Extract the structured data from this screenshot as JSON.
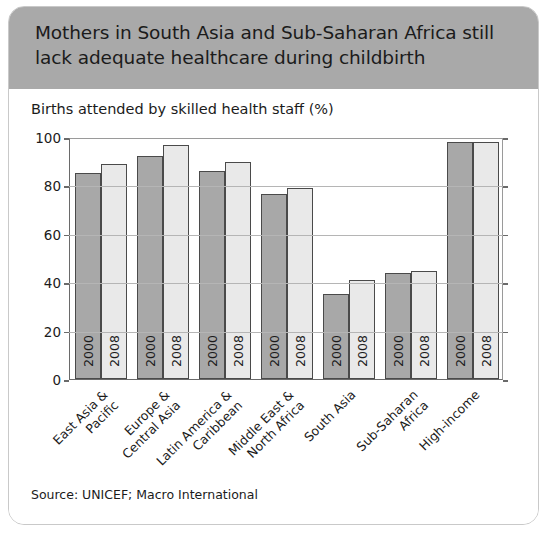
{
  "card": {
    "header_title": "Mothers in South Asia and Sub-Saharan Africa still\nlack adequate healthcare during childbirth",
    "subtitle": "Births attended by skilled health staff (%)",
    "source": "Source: UNICEF; Macro International"
  },
  "colors": {
    "header_band": "#a9a9a9",
    "bar_2000": "#a8a8a8",
    "bar_2008": "#e9e9e9",
    "bar_outline": "#4a4a4a",
    "gridline": "#b5b5b5",
    "axis": "#6a6a6a",
    "card_border": "#c9c9c9"
  },
  "chart_data": {
    "type": "bar",
    "title": "Mothers in South Asia and Sub-Saharan Africa still lack adequate healthcare during childbirth",
    "subtitle": "Births attended by skilled health staff (%)",
    "source": "Source: UNICEF; Macro International",
    "xlabel": "",
    "ylabel": "Births attended by skilled health staff (%)",
    "ylim": [
      0,
      100
    ],
    "yticks": [
      0,
      20,
      40,
      60,
      80,
      100
    ],
    "grid": true,
    "legend": "none",
    "bar_value_labels": [
      "2000",
      "2008"
    ],
    "categories": [
      "East Asia &\nPacific",
      "Europe &\nCentral Asia",
      "Latin America &\nCaribbean",
      "Middle East &\nNorth Africa",
      "South Asia",
      "Sub-Saharan\nAfrica",
      "High-income"
    ],
    "series": [
      {
        "name": "2000",
        "values": [
          85,
          92,
          86,
          76.5,
          35,
          44,
          98
        ]
      },
      {
        "name": "2008",
        "values": [
          89,
          96.5,
          89.5,
          79,
          41,
          44.7,
          98
        ]
      }
    ]
  }
}
